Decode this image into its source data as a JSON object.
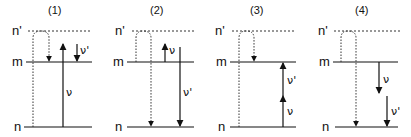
{
  "figure": {
    "level_labels": {
      "upper": "n'",
      "middle": "m",
      "lower": "n"
    },
    "panels": [
      {
        "id": "(1)",
        "arrows": [
          {
            "label": "ν",
            "direction": "up",
            "from": "n",
            "to": "m_upper_ext",
            "style": "solid"
          },
          {
            "label": "ν'",
            "direction": "down",
            "from": "above_m",
            "to": "m",
            "style": "solid"
          }
        ],
        "virtual_path": {
          "from": "n",
          "via": "n'",
          "to": "m"
        }
      },
      {
        "id": "(2)",
        "arrows": [
          {
            "label": "ν",
            "direction": "up",
            "from": "m",
            "to": "above_m",
            "style": "solid"
          },
          {
            "label": "ν'",
            "direction": "down",
            "from": "above_m",
            "to": "n",
            "style": "solid"
          }
        ],
        "virtual_path": {
          "from": "m",
          "via": "n'",
          "to": "n"
        }
      },
      {
        "id": "(3)",
        "arrows": [
          {
            "label": "ν",
            "direction": "up",
            "from": "n",
            "to": "mid",
            "style": "solid"
          },
          {
            "label": "ν'",
            "direction": "up",
            "from": "mid",
            "to": "m",
            "style": "solid"
          }
        ],
        "virtual_path": {
          "from": "n",
          "via": "n'",
          "to": "m"
        }
      },
      {
        "id": "(4)",
        "arrows": [
          {
            "label": "ν",
            "direction": "down",
            "from": "m",
            "to": "mid",
            "style": "solid"
          },
          {
            "label": "ν'",
            "direction": "down",
            "from": "mid",
            "to": "n",
            "style": "solid"
          }
        ],
        "virtual_path": {
          "from": "m",
          "via": "n'",
          "to": "n"
        }
      }
    ]
  }
}
